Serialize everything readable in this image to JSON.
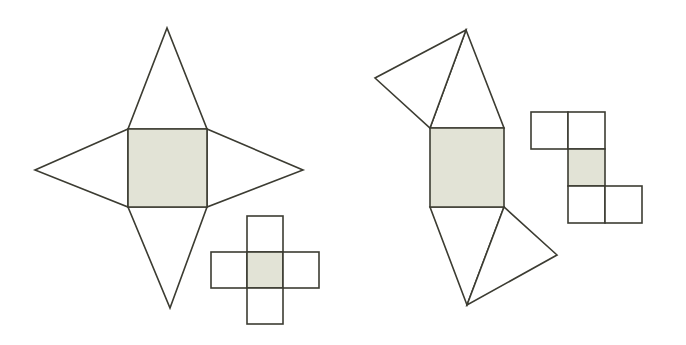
{
  "canvas": {
    "width": 686,
    "height": 345,
    "background": "#ffffff"
  },
  "style": {
    "stroke_color": "#3c3c32",
    "stroke_width": 1.6,
    "shaded_fill": "#e2e3d6",
    "blank_fill": "#ffffff"
  },
  "figures": [
    {
      "id": "left-polyhedron-net",
      "name": "square-pyramid-star-net",
      "description": "Four isosceles triangles attached to the four edges of a central shaded square, forming a four-pointed star",
      "central_square": {
        "label": "shaded-base-square",
        "fill": "#e2e3d6",
        "points": "128,129 207,129 207,207 128,207",
        "x": 128,
        "y": 129,
        "size": 79
      },
      "triangles": [
        {
          "label": "top-triangle",
          "fill": "#ffffff",
          "points": "128,129 207,129 167,28"
        },
        {
          "label": "right-triangle",
          "fill": "#ffffff",
          "points": "207,129 207,207 303,170"
        },
        {
          "label": "bottom-triangle",
          "fill": "#ffffff",
          "points": "128,207 207,207 170,308"
        },
        {
          "label": "left-triangle",
          "fill": "#ffffff",
          "points": "128,129 128,207 35,170"
        }
      ]
    },
    {
      "id": "left-polyomino-net",
      "name": "cross-pentomino-net",
      "description": "Plus-shaped arrangement of five unit squares with the centre square shaded",
      "cell_size": 36,
      "origin": {
        "x": 211,
        "y": 216
      },
      "cells": [
        {
          "label": "top-cell",
          "col": 1,
          "row": 0,
          "fill": "#ffffff"
        },
        {
          "label": "left-cell",
          "col": 0,
          "row": 1,
          "fill": "#ffffff"
        },
        {
          "label": "centre-cell",
          "col": 1,
          "row": 1,
          "fill": "#e2e3d6"
        },
        {
          "label": "right-cell",
          "col": 2,
          "row": 1,
          "fill": "#ffffff"
        },
        {
          "label": "bottom-cell",
          "col": 1,
          "row": 2,
          "fill": "#ffffff"
        }
      ]
    },
    {
      "id": "right-polyhedron-net",
      "name": "skew-pyramid-star-net",
      "description": "Four triangles attached to the edges of a central shaded square arranged in a rotated pinwheel fashion",
      "central_square": {
        "label": "shaded-base-square",
        "fill": "#e2e3d6",
        "points": "430,128 504,128 504,207 430,207",
        "x": 430,
        "y": 128,
        "size": 78
      },
      "triangles": [
        {
          "label": "top-right-triangle",
          "fill": "#ffffff",
          "points": "430,128 504,128 466,30"
        },
        {
          "label": "top-left-triangle",
          "fill": "#ffffff",
          "points": "430,128 466,30 375,78"
        },
        {
          "label": "bottom-left-triangle",
          "fill": "#ffffff",
          "points": "430,207 504,207 467,305"
        },
        {
          "label": "bottom-right-triangle",
          "fill": "#ffffff",
          "points": "504,207 467,305 557,255"
        }
      ]
    },
    {
      "id": "right-polyomino-net",
      "name": "z-pentomino-net",
      "description": "Z- or S-shaped arrangement of five unit squares with the middle square shaded",
      "cell_size": 37,
      "origin": {
        "x": 531,
        "y": 112
      },
      "cells": [
        {
          "label": "top-left-cell",
          "col": 0,
          "row": 0,
          "fill": "#ffffff"
        },
        {
          "label": "top-right-cell",
          "col": 1,
          "row": 0,
          "fill": "#ffffff"
        },
        {
          "label": "centre-cell",
          "col": 1,
          "row": 1,
          "fill": "#e2e3d6"
        },
        {
          "label": "bottom-left-cell",
          "col": 1,
          "row": 2,
          "fill": "#ffffff"
        },
        {
          "label": "bottom-right-cell",
          "col": 2,
          "row": 2,
          "fill": "#ffffff"
        }
      ]
    }
  ]
}
